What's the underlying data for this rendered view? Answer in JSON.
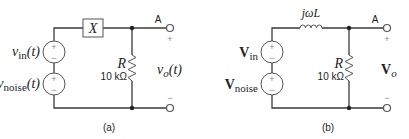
{
  "circuit_a": {
    "caption": "(a)",
    "source_top_label_main": "v",
    "source_top_label_sub": "in",
    "source_top_label_arg": "(t)",
    "source_bottom_label_main": "v",
    "source_bottom_label_sub": "noise",
    "source_bottom_label_arg": "(t)",
    "element_label": "X",
    "resistor_name": "R",
    "resistor_value": "10 kΩ",
    "node_label": "A",
    "output_main": "v",
    "output_sub": "o",
    "output_arg": "(t)",
    "plus": "+",
    "minus": "−"
  },
  "circuit_b": {
    "caption": "(b)",
    "source_top_label_main": "V",
    "source_top_label_sub": "in",
    "source_bottom_label_main": "V",
    "source_bottom_label_sub": "noise",
    "inductor_label": "jωL",
    "resistor_name": "R",
    "resistor_value": "10 kΩ",
    "node_label": "A",
    "output_main": "V",
    "output_sub": "o",
    "plus": "+",
    "minus": "−"
  }
}
